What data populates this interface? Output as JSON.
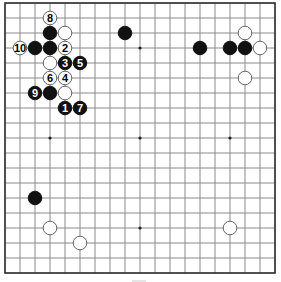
{
  "board": {
    "size": 19,
    "origin_x": 5,
    "origin_y": 3,
    "spacing": 15,
    "grid_color": "#8a8a8a",
    "border_color": "#333333",
    "background": "#ffffff",
    "hoshi": [
      [
        3,
        3
      ],
      [
        9,
        3
      ],
      [
        15,
        3
      ],
      [
        3,
        9
      ],
      [
        9,
        9
      ],
      [
        15,
        9
      ],
      [
        3,
        15
      ],
      [
        9,
        15
      ],
      [
        15,
        15
      ]
    ]
  },
  "stones": [
    {
      "color": "white",
      "col": 3,
      "row": 1,
      "label": "8"
    },
    {
      "color": "black",
      "col": 3,
      "row": 2,
      "label": ""
    },
    {
      "color": "white",
      "col": 4,
      "row": 2,
      "label": ""
    },
    {
      "color": "white",
      "col": 1,
      "row": 3,
      "label": "10"
    },
    {
      "color": "black",
      "col": 2,
      "row": 3,
      "label": ""
    },
    {
      "color": "black",
      "col": 3,
      "row": 3,
      "label": ""
    },
    {
      "color": "white",
      "col": 4,
      "row": 3,
      "label": "2"
    },
    {
      "color": "white",
      "col": 3,
      "row": 4,
      "label": ""
    },
    {
      "color": "black",
      "col": 4,
      "row": 4,
      "label": "3"
    },
    {
      "color": "black",
      "col": 5,
      "row": 4,
      "label": "5"
    },
    {
      "color": "white",
      "col": 3,
      "row": 5,
      "label": "6"
    },
    {
      "color": "white",
      "col": 4,
      "row": 5,
      "label": "4"
    },
    {
      "color": "black",
      "col": 2,
      "row": 6,
      "label": "9"
    },
    {
      "color": "black",
      "col": 3,
      "row": 6,
      "label": ""
    },
    {
      "color": "white",
      "col": 4,
      "row": 6,
      "label": ""
    },
    {
      "color": "black",
      "col": 4,
      "row": 7,
      "label": "1"
    },
    {
      "color": "black",
      "col": 5,
      "row": 7,
      "label": "7"
    },
    {
      "color": "black",
      "col": 8,
      "row": 2,
      "label": ""
    },
    {
      "color": "black",
      "col": 13,
      "row": 3,
      "label": ""
    },
    {
      "color": "white",
      "col": 16,
      "row": 2,
      "label": ""
    },
    {
      "color": "black",
      "col": 15,
      "row": 3,
      "label": ""
    },
    {
      "color": "black",
      "col": 16,
      "row": 3,
      "label": ""
    },
    {
      "color": "white",
      "col": 17,
      "row": 3,
      "label": ""
    },
    {
      "color": "white",
      "col": 16,
      "row": 5,
      "label": ""
    },
    {
      "color": "black",
      "col": 2,
      "row": 13,
      "label": ""
    },
    {
      "color": "white",
      "col": 3,
      "row": 15,
      "label": ""
    },
    {
      "color": "white",
      "col": 5,
      "row": 16,
      "label": ""
    },
    {
      "color": "white",
      "col": 15,
      "row": 15,
      "label": ""
    }
  ]
}
